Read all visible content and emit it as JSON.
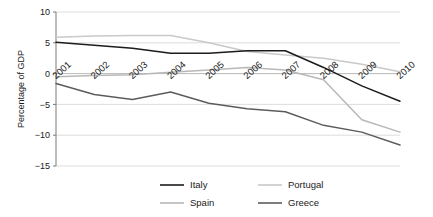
{
  "chart_data": {
    "type": "line",
    "title": "",
    "xlabel": "",
    "ylabel": "Percentage of GDP",
    "ylim": [
      -15,
      10
    ],
    "yticks": [
      10,
      5,
      0,
      -5,
      -10,
      -15
    ],
    "ytick_labels": [
      "10",
      "5",
      "0",
      "−5",
      "−10",
      "−15"
    ],
    "categories": [
      "2001",
      "2002",
      "2003",
      "2004",
      "2005",
      "2006",
      "2007",
      "2008",
      "2009",
      "2010"
    ],
    "grid": true,
    "legend_position": "bottom",
    "series": [
      {
        "name": "Italy",
        "color": "#1c1c1c",
        "values": [
          5.1,
          4.6,
          4.1,
          3.3,
          3.3,
          3.7,
          3.7,
          1.0,
          -2.0,
          -4.5
        ]
      },
      {
        "name": "Spain",
        "color": "#b8b8b8",
        "values": [
          -0.5,
          -0.3,
          -0.2,
          0.2,
          0.6,
          1.0,
          0.6,
          -1.0,
          -7.5,
          -9.5
        ]
      },
      {
        "name": "Portugal",
        "color": "#c9c9c9",
        "values": [
          5.9,
          6.1,
          6.2,
          6.2,
          5.0,
          3.6,
          3.0,
          2.5,
          1.5,
          0.3
        ]
      },
      {
        "name": "Greece",
        "color": "#5c5c5c",
        "values": [
          -1.6,
          -3.4,
          -4.2,
          -3.0,
          -4.8,
          -5.7,
          -6.2,
          -8.4,
          -9.5,
          -11.6
        ]
      }
    ]
  },
  "legend": {
    "entries": [
      {
        "label": "Italy",
        "color": "#1c1c1c"
      },
      {
        "label": "Portugal",
        "color": "#c9c9c9"
      },
      {
        "label": "Spain",
        "color": "#b8b8b8"
      },
      {
        "label": "Greece",
        "color": "#5c5c5c"
      }
    ]
  }
}
